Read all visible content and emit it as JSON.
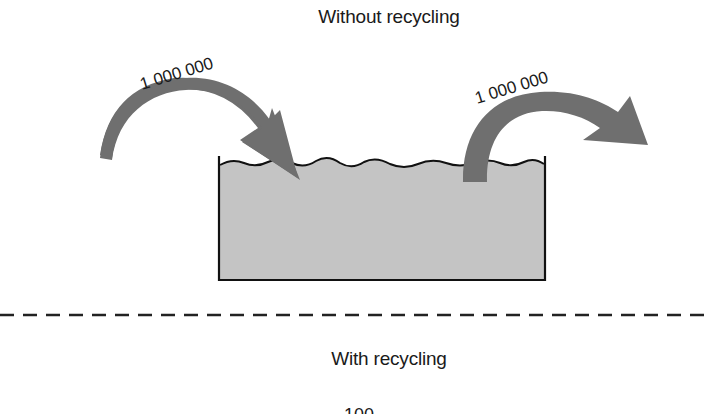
{
  "sections": {
    "top": {
      "title": "Without recycling"
    },
    "bottom": {
      "title": "With recycling",
      "partial_label": "100"
    }
  },
  "diagram": {
    "inflow": {
      "label": "1 000 000",
      "direction": "into-tank"
    },
    "outflow": {
      "label": "1 000 000",
      "direction": "out-of-tank"
    },
    "tank": {
      "description": "container of liquid with wavy surface"
    },
    "separator": "dashed-line"
  },
  "colors": {
    "arrow": "#6f6f6f",
    "liquid": "#c4c4c4",
    "outline": "#111111",
    "text": "#1a1a1a"
  }
}
